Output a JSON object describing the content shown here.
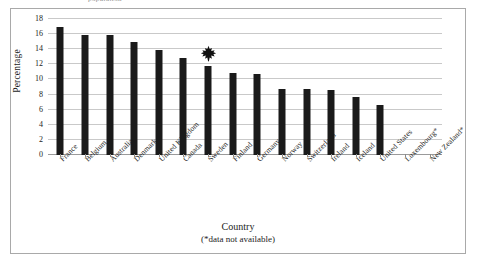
{
  "figure": {
    "top_clipped_text": "population",
    "frame_color": "#a9a9a9",
    "background": "#ffffff"
  },
  "axes": {
    "y_title": "Percentage",
    "x_title": "Country",
    "x_title_note": "(*data not available)",
    "y_ticks": [
      "18",
      "16",
      "14",
      "12",
      "10",
      "8",
      "6",
      "4",
      "2",
      "0"
    ]
  },
  "marker": {
    "name": "maple-leaf-icon",
    "over_category": "Sweden",
    "color": "#111111"
  },
  "chart_data": {
    "type": "bar",
    "title": "",
    "xlabel": "Country (*data not available)",
    "ylabel": "Percentage",
    "ylim": [
      0,
      18
    ],
    "ytick_step": 2,
    "grid": true,
    "legend": false,
    "bar_color": "#1a1a1a",
    "categories": [
      "France",
      "Belgium",
      "Australia",
      "Denmark",
      "United Kingdom",
      "Canada",
      "Sweden",
      "Finland",
      "Germany",
      "Norway",
      "Switzerland",
      "Ireland",
      "Iceland",
      "United States",
      "Luxembourg*",
      "New Zealand*"
    ],
    "values": [
      16.9,
      15.9,
      15.9,
      14.9,
      13.9,
      12.8,
      11.8,
      10.8,
      10.75,
      8.7,
      8.7,
      8.65,
      7.7,
      6.6,
      null,
      null
    ]
  }
}
